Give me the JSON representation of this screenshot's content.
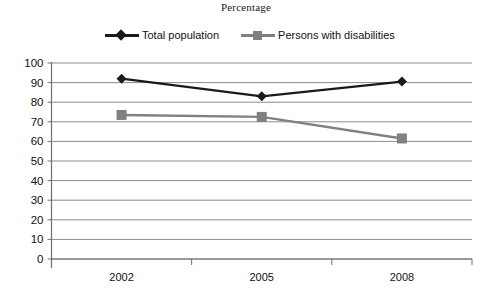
{
  "chart_data": {
    "type": "line",
    "title": "Percentage",
    "xlabel": "",
    "ylabel": "",
    "categories": [
      "2002",
      "2005",
      "2008"
    ],
    "series": [
      {
        "name": "Total population",
        "values": [
          92,
          83,
          90.5
        ],
        "color": "#1a1a1a",
        "marker": "diamond"
      },
      {
        "name": "Persons with disabilities",
        "values": [
          73.5,
          72.5,
          61.5
        ],
        "color": "#808080",
        "marker": "square"
      }
    ],
    "ylim": [
      0,
      100
    ],
    "ytick_labels": [
      "100",
      "90",
      "80",
      "70",
      "60",
      "50",
      "40",
      "30",
      "20",
      "10",
      "0"
    ],
    "ytick_values": [
      100,
      90,
      80,
      70,
      60,
      50,
      40,
      30,
      20,
      10,
      0
    ],
    "grid": "horizontal",
    "legend_position": "top"
  },
  "legend": {
    "items": [
      {
        "label": "Total population",
        "color": "#1a1a1a",
        "marker": "diamond"
      },
      {
        "label": "Persons with disabilities",
        "color": "#808080",
        "marker": "square"
      }
    ]
  },
  "colors": {
    "total_population": "#1a1a1a",
    "persons_with_disabilities": "#808080",
    "gridline": "#8c8c8c",
    "axis": "#6e6e6e"
  }
}
